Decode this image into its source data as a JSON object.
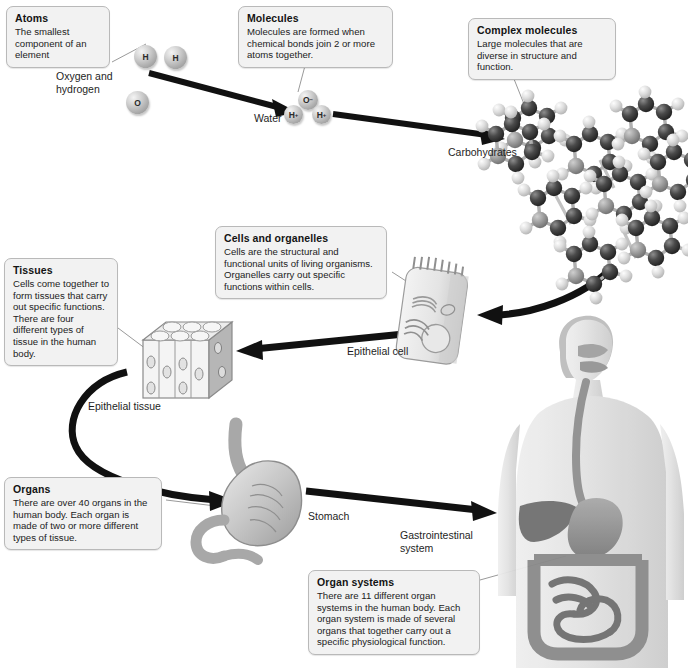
{
  "diagram": {
    "accent_gray": "#f2f2f2",
    "border_gray": "#b9b9b9",
    "arrow_color": "#111111",
    "leader_color": "#9a9a9a"
  },
  "callouts": [
    {
      "id": "atoms",
      "title": "Atoms",
      "body": "The smallest component of an element"
    },
    {
      "id": "molecules",
      "title": "Molecules",
      "body": "Molecules are formed when chemical bonds join 2 or more atoms together."
    },
    {
      "id": "complex-molecules",
      "title": "Complex molecules",
      "body": "Large molecules that are diverse in structure and function."
    },
    {
      "id": "cells-and-organelles",
      "title": "Cells and organelles",
      "body": "Cells are the structural and functional units of living organisms. Organelles carry out specific functions within cells."
    },
    {
      "id": "tissues",
      "title": "Tissues",
      "body": "Cells come together to form tissues that carry out specific functions. There are four different types of tissue in the human body."
    },
    {
      "id": "organs",
      "title": "Organs",
      "body": "There are over 40 organs in the human body. Each organ is made of two or more different types of tissue."
    },
    {
      "id": "organ-systems",
      "title": "Organ systems",
      "body": "There are 11 different organ systems in the human body. Each organ system is made of several organs that together carry out a specific physiological function."
    }
  ],
  "labels": {
    "oxygen_hydrogen": "Oxygen and\nhydrogen",
    "water": "Water",
    "carbohydrates": "Carbohydrates",
    "epithelial_cell": "Epithelial cell",
    "epithelial_tissue": "Epithelial tissue",
    "stomach": "Stomach",
    "gastrointestinal_system": "Gastrointestinal\nsystem"
  },
  "atoms": [
    {
      "symbol": "H",
      "charge": ""
    },
    {
      "symbol": "H",
      "charge": ""
    },
    {
      "symbol": "O",
      "charge": ""
    }
  ],
  "water_molecule": [
    {
      "symbol": "O",
      "charge": "−"
    },
    {
      "symbol": "H",
      "charge": "+"
    },
    {
      "symbol": "H",
      "charge": "+"
    }
  ],
  "illustrations": [
    {
      "id": "atom-group",
      "name": "oxygen and hydrogen atoms"
    },
    {
      "id": "water-molecule",
      "name": "water molecule"
    },
    {
      "id": "carbohydrate",
      "name": "carbohydrate ball-and-stick molecules"
    },
    {
      "id": "epithelial-cell",
      "name": "columnar epithelial cell with organelles"
    },
    {
      "id": "epithelial-tissue",
      "name": "block of epithelial tissue"
    },
    {
      "id": "stomach",
      "name": "stomach with rugae and duodenum"
    },
    {
      "id": "human-body",
      "name": "human torso with gastrointestinal system"
    }
  ]
}
